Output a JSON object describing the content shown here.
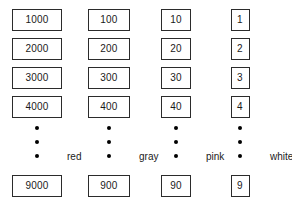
{
  "diagram": {
    "background_color": "#ffffff",
    "border_color": "#2b2b2b",
    "text_color": "#1a1a1a",
    "dot_color": "#000000",
    "ellipsis_dot_count": 3,
    "columns": [
      {
        "name": "thousands",
        "label": "red",
        "center_x": 37,
        "box_width": 50,
        "box_height": 22,
        "values": [
          "1000",
          "2000",
          "3000",
          "4000"
        ],
        "last_value": "9000"
      },
      {
        "name": "hundreds",
        "label": "gray",
        "center_x": 109,
        "box_width": 42,
        "box_height": 22,
        "values": [
          "100",
          "200",
          "300",
          "400"
        ],
        "last_value": "900"
      },
      {
        "name": "tens",
        "label": "pink",
        "center_x": 176,
        "box_width": 30,
        "box_height": 22,
        "values": [
          "10",
          "20",
          "30",
          "40"
        ],
        "last_value": "90"
      },
      {
        "name": "ones",
        "label": "white",
        "center_x": 240,
        "box_width": 19,
        "box_height": 22,
        "values": [
          "1",
          "2",
          "3",
          "4"
        ],
        "last_value": "9"
      }
    ],
    "row_tops": [
      9,
      38,
      67,
      96
    ],
    "dots_top": 126,
    "dots_height": 32,
    "last_row_top": 175,
    "label_offset_x": 30,
    "label_y": 152
  }
}
